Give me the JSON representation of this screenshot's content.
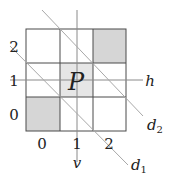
{
  "diagram": {
    "title": "",
    "grid": {
      "rows": 3,
      "cols": 3,
      "shaded_cells": [
        {
          "col": 2,
          "row": 2,
          "tone": "dark"
        },
        {
          "col": 1,
          "row": 1,
          "tone": "light"
        },
        {
          "col": 0,
          "row": 0,
          "tone": "dark"
        }
      ],
      "center_label": "P"
    },
    "row_labels": [
      "0",
      "1",
      "2"
    ],
    "col_labels": [
      "0",
      "1",
      "2"
    ],
    "lines": {
      "h": "h",
      "v": "v",
      "d1": "d",
      "d1_sub": "1",
      "d2": "d",
      "d2_sub": "2"
    },
    "colors": {
      "grid": "#444444",
      "axis": "#888888",
      "diag": "#aaaaaa",
      "shade_dark": "#d6d6d6",
      "shade_light": "#e4e4e4"
    }
  }
}
